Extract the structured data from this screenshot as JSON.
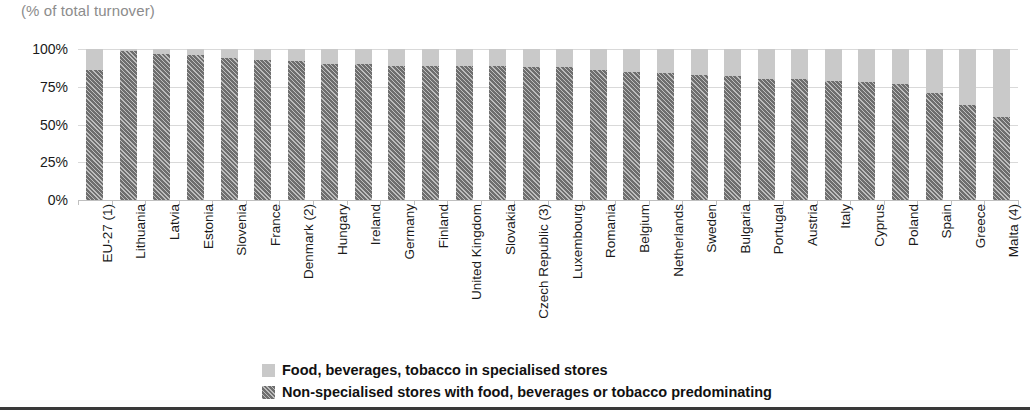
{
  "chart_data": {
    "type": "bar",
    "subtype": "stacked-100-percent",
    "title": "(% of total turnover)",
    "xlabel": "",
    "ylabel": "",
    "ylim": [
      0,
      100
    ],
    "yticks": [
      "0%",
      "25%",
      "50%",
      "75%",
      "100%"
    ],
    "ytick_values": [
      0,
      25,
      50,
      75,
      100
    ],
    "grid": true,
    "legend_position": "bottom",
    "categories": [
      "EU-27 (1)",
      "Lithuania",
      "Latvia",
      "Estonia",
      "Slovenia",
      "France",
      "Denmark (2)",
      "Hungary",
      "Ireland",
      "Germany",
      "Finland",
      "United Kingdom",
      "Slovakia",
      "Czech Republic (3)",
      "Luxembourg",
      "Romania",
      "Belgium",
      "Netherlands",
      "Sweden",
      "Bulgaria",
      "Portugal",
      "Austria",
      "Italy",
      "Cyprus",
      "Poland",
      "Spain",
      "Greece",
      "Malta (4)"
    ],
    "series": [
      {
        "name": "Non-specialised stores with food, beverages or tobacco predominating",
        "color": "#6e6e6e",
        "pattern": "diagonal-hatch",
        "values": [
          86,
          99,
          97,
          96,
          94,
          93,
          92,
          90,
          90,
          89,
          89,
          89,
          89,
          88,
          88,
          86,
          85,
          84,
          83,
          82,
          80,
          80,
          79,
          78,
          77,
          71,
          63,
          55
        ]
      },
      {
        "name": "Food, beverages, tobacco in specialised stores",
        "color": "#c9c9c9",
        "pattern": "solid",
        "values": [
          14,
          1,
          3,
          4,
          6,
          7,
          8,
          10,
          10,
          11,
          11,
          11,
          11,
          12,
          12,
          14,
          15,
          16,
          17,
          18,
          20,
          20,
          21,
          22,
          23,
          29,
          37,
          45
        ]
      }
    ],
    "legend": [
      {
        "label": "Food, beverages, tobacco in specialised stores",
        "swatch": "light"
      },
      {
        "label": "Non-specialised stores with food, beverages or tobacco predominating",
        "swatch": "dark"
      }
    ]
  }
}
